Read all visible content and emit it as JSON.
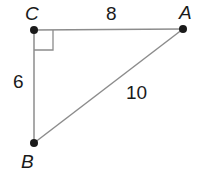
{
  "diagram": {
    "type": "right-triangle",
    "colors": {
      "stroke": "#8c8c8c",
      "vertex": "#1a1a1a",
      "text": "#1a1a1a"
    },
    "vertices": {
      "A": {
        "label": "A",
        "x": 183,
        "y": 29
      },
      "B": {
        "label": "B",
        "x": 34,
        "y": 143
      },
      "C": {
        "label": "C",
        "x": 34,
        "y": 30
      }
    },
    "right_angle_at": "C",
    "sides": {
      "CA": {
        "label": "8"
      },
      "CB": {
        "label": "6"
      },
      "AB": {
        "label": "10"
      }
    }
  }
}
